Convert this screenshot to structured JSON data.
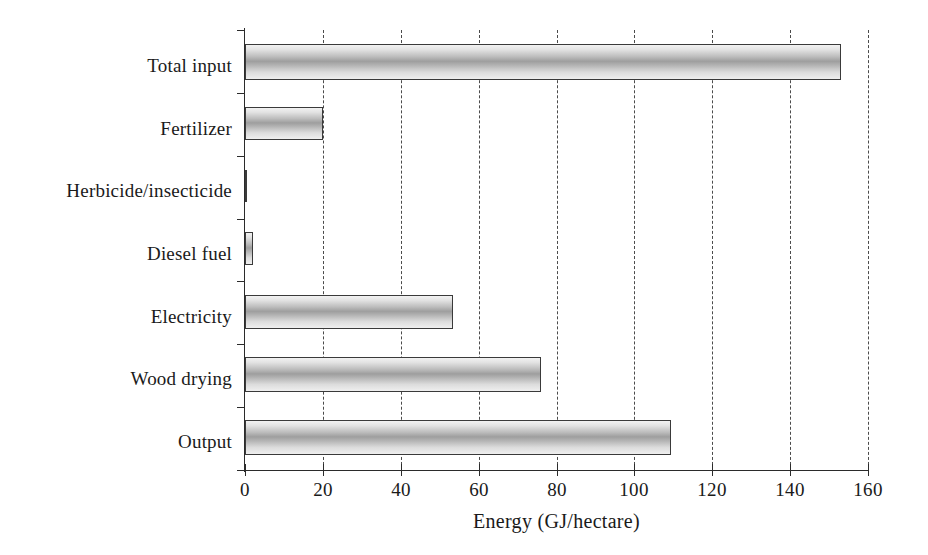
{
  "chart_data": {
    "type": "bar",
    "orientation": "horizontal",
    "title": "",
    "subtitle": "",
    "xlabel": "Energy (GJ/hectare)",
    "ylabel": "",
    "categories": [
      "Total input",
      "Fertilizer",
      "Herbicide/insecticide",
      "Diesel fuel",
      "Electricity",
      "Wood drying",
      "Output"
    ],
    "values": [
      153,
      20,
      0.6,
      2,
      53.5,
      76,
      109.5
    ],
    "series": [
      {
        "name": "Energy",
        "values": [
          153,
          20,
          0.6,
          2,
          53.5,
          76,
          109.5
        ]
      }
    ],
    "xlim": [
      0,
      160
    ],
    "xticks": [
      0,
      20,
      40,
      60,
      80,
      100,
      120,
      140,
      160
    ],
    "xtick_labels": [
      "0",
      "20",
      "40",
      "60",
      "80",
      "100",
      "120",
      "140",
      "160"
    ],
    "grid": "vertical-dashed",
    "legend": null,
    "legend_position": "none",
    "bar_fill": "#b4b4b4",
    "bar_edge": "#3a3a3a",
    "grid_color": "#4a4a4a",
    "axis_color": "#2b2b2b",
    "background": "#ffffff"
  }
}
